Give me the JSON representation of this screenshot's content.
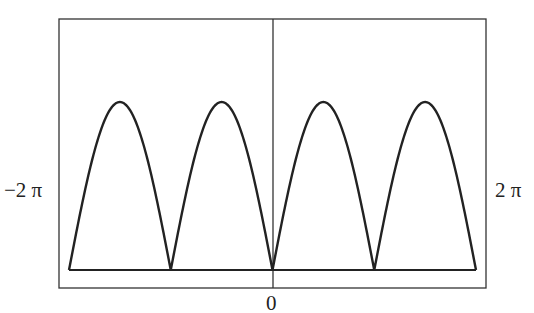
{
  "chart_data": {
    "type": "line",
    "title": "",
    "function": "|sin(x)| style arches (rectified sine) over [-2π, 2π]",
    "xlabel": "",
    "ylabel": "",
    "xlim_labels": {
      "left": "−2 π",
      "right": "2 π"
    },
    "x_ticks": [
      "0"
    ],
    "x": [
      -6.283,
      -4.712,
      -3.1416,
      -1.571,
      0,
      1.571,
      3.1416,
      4.712,
      6.283
    ],
    "values": [
      0,
      1,
      0,
      1,
      0,
      1,
      0,
      1,
      0
    ],
    "arches": 4,
    "grid": false,
    "legend": "none",
    "baseline_drawn": true,
    "vertical_axis_at": 0
  },
  "labels": {
    "left": "−2 π",
    "right": "2 π",
    "zero": "0"
  }
}
